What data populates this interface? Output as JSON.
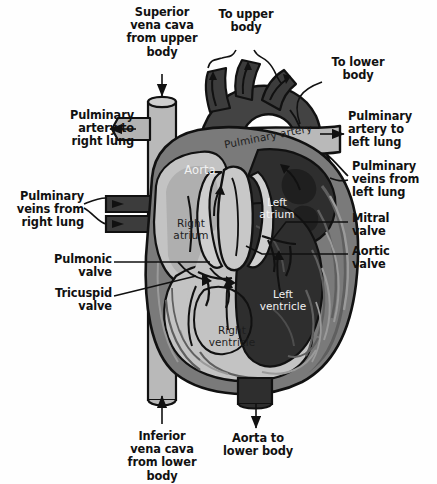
{
  "diagram": {
    "background_color": "#fefefe",
    "palette": {
      "outline": "#111111",
      "deoxygenated_dark": "#3c3c3c",
      "vessel_light": "#b9b9b9",
      "chamber_light": "#c3c3c3",
      "chamber_mid": "#8d8d8d",
      "chamber_dark": "#2e2e2e",
      "myocardium": "#7a7a7a",
      "aorta_dark": "#434343",
      "text_dark": "#111111",
      "text_light": "#f2f2f2"
    }
  },
  "callouts": {
    "superior_vena_cava": "Superior\nvena cava\nfrom upper\nbody",
    "to_upper_body": "To upper\nbody",
    "to_lower_body": "To lower\nbody",
    "pulminary_artery_right_lung": "Pulminary\nartery to\nright lung",
    "pulminary_artery_left_lung": "Pulminary\nartery to\nleft lung",
    "pulminary_veins_right_lung": "Pulminary\nveins from\nright lung",
    "pulminary_veins_left_lung": "Pulminary\nveins from\nleft lung",
    "mitral_valve": "Mitral\nvalve",
    "aortic_valve": "Aortic\nvalve",
    "pulmonic_valve": "Pulmonic\nvalve",
    "tricuspid_valve": "Tricuspid\nvalve",
    "inferior_vena_cava": "Inferior\nvena cava\nfrom lower\nbody",
    "aorta_to_lower_body": "Aorta to\nlower body"
  },
  "internal_labels": {
    "pulminary_artery": "Pulminary artery",
    "aorta": "Aorta",
    "right_atrium": "Right\natrium",
    "left_atrium": "Left\natrium",
    "right_ventricle": "Right\nventricle",
    "left_ventricle": "Left\nventricle"
  }
}
